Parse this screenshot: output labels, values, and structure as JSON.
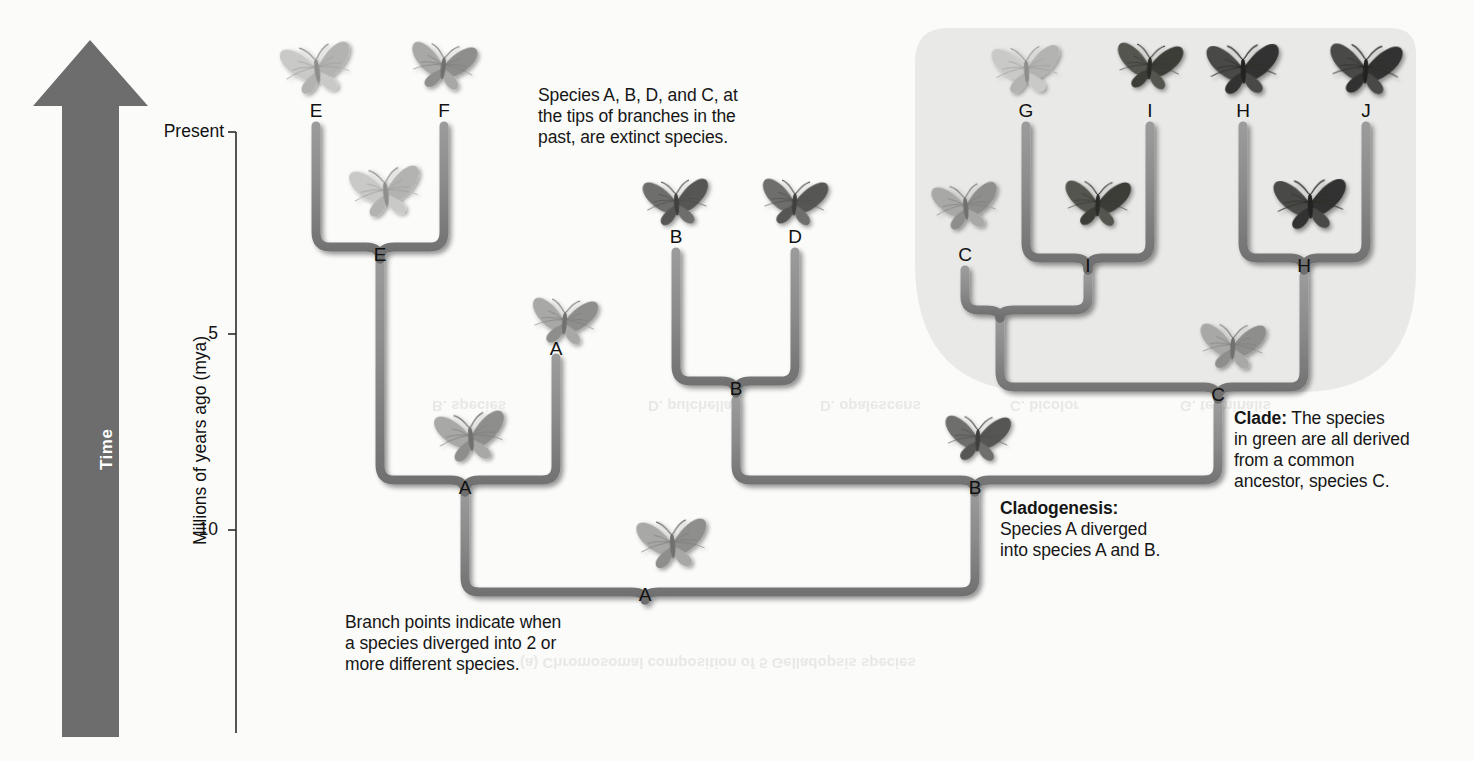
{
  "figure": {
    "type": "phylogenetic-tree"
  },
  "axis": {
    "y_title": "Millions of years ago (mya)",
    "ticks": [
      {
        "label": "Present",
        "value": 0
      },
      {
        "label": "5",
        "value": 5
      },
      {
        "label": "10",
        "value": 10
      }
    ]
  },
  "time_arrow": {
    "label": "Time",
    "direction": "up"
  },
  "annotations": [
    {
      "id": "extinct-note",
      "lead": "",
      "text": "Species A, B, D, and C, at\nthe  tips of branches in the\npast, are extinct species."
    },
    {
      "id": "clade-note",
      "lead": "Clade:",
      "text": " The species\nin green are all derived\nfrom a common\nancestor, species C."
    },
    {
      "id": "cladogenesis-note",
      "lead": "Cladogenesis:",
      "text": "\nSpecies A diverged\ninto species A and B."
    },
    {
      "id": "branch-point-note",
      "lead": "",
      "text": "Branch points indicate when\na species diverged into 2 or\nmore different species."
    }
  ],
  "tips": [
    {
      "id": "tip-E",
      "label": "E",
      "x": 316,
      "y": 113
    },
    {
      "id": "tip-F",
      "label": "F",
      "x": 444,
      "y": 113
    },
    {
      "id": "tip-B",
      "label": "B",
      "x": 676,
      "y": 239
    },
    {
      "id": "tip-D",
      "label": "D",
      "x": 795,
      "y": 239
    },
    {
      "id": "tip-A",
      "label": "A",
      "x": 556,
      "y": 351
    },
    {
      "id": "tip-G",
      "label": "G",
      "x": 1026,
      "y": 113
    },
    {
      "id": "tip-I",
      "label": "I",
      "x": 1150,
      "y": 113
    },
    {
      "id": "tip-H",
      "label": "H",
      "x": 1243,
      "y": 113
    },
    {
      "id": "tip-J",
      "label": "J",
      "x": 1366,
      "y": 113
    },
    {
      "id": "tip-C",
      "label": "C",
      "x": 965,
      "y": 257
    }
  ],
  "nodes": [
    {
      "id": "node-E",
      "label": "E",
      "x": 380,
      "y": 257
    },
    {
      "id": "node-B-mid",
      "label": "B",
      "x": 736,
      "y": 391
    },
    {
      "id": "node-A-left",
      "label": "A",
      "x": 465,
      "y": 490
    },
    {
      "id": "node-B-right",
      "label": "B",
      "x": 975,
      "y": 490
    },
    {
      "id": "node-I",
      "label": "I",
      "x": 1088,
      "y": 268
    },
    {
      "id": "node-H",
      "label": "H",
      "x": 1304,
      "y": 268
    },
    {
      "id": "node-C",
      "label": "C",
      "x": 1218,
      "y": 397
    },
    {
      "id": "node-A-root",
      "label": "A",
      "x": 645,
      "y": 597
    }
  ],
  "clade": {
    "label": "green-clade-highlight",
    "fill": "#e9e9e7",
    "members": [
      "C",
      "G",
      "I",
      "H",
      "J"
    ]
  },
  "colors": {
    "branch": "#8d8d8d",
    "branch_edge": "#6f6f6f",
    "arrow": "#6d6d6d",
    "axis": "#2b2b2b",
    "background": "#fbfbfa",
    "clade_fill": "#e9e9e7"
  },
  "butterflies": [
    {
      "id": "butterfly-E-tip",
      "x": 316,
      "y": 62,
      "w": 62,
      "shade": "light",
      "rot": -8
    },
    {
      "id": "butterfly-F-tip",
      "x": 444,
      "y": 60,
      "w": 58,
      "shade": "mid",
      "rot": 6
    },
    {
      "id": "butterfly-E-node",
      "x": 385,
      "y": 185,
      "w": 62,
      "shade": "light",
      "rot": -6
    },
    {
      "id": "butterfly-A-tip",
      "x": 565,
      "y": 315,
      "w": 58,
      "shade": "mid",
      "rot": 4
    },
    {
      "id": "butterfly-A-node",
      "x": 470,
      "y": 430,
      "w": 62,
      "shade": "mid",
      "rot": -6
    },
    {
      "id": "butterfly-B-tip",
      "x": 676,
      "y": 196,
      "w": 58,
      "shade": "dark",
      "rot": -4
    },
    {
      "id": "butterfly-D-tip",
      "x": 795,
      "y": 196,
      "w": 58,
      "shade": "dark",
      "rot": 4
    },
    {
      "id": "butterfly-B-node",
      "x": 978,
      "y": 432,
      "w": 58,
      "shade": "dark",
      "rot": 2
    },
    {
      "id": "butterfly-A-root",
      "x": 672,
      "y": 537,
      "w": 62,
      "shade": "mid",
      "rot": -4
    },
    {
      "id": "butterfly-C-tip",
      "x": 965,
      "y": 200,
      "w": 58,
      "shade": "mid",
      "rot": -6
    },
    {
      "id": "butterfly-G-tip",
      "x": 1026,
      "y": 63,
      "w": 60,
      "shade": "light",
      "rot": -4
    },
    {
      "id": "butterfly-I-tip",
      "x": 1150,
      "y": 60,
      "w": 58,
      "shade": "darker",
      "rot": 4
    },
    {
      "id": "butterfly-I-node",
      "x": 1098,
      "y": 197,
      "w": 58,
      "shade": "darker",
      "rot": 2
    },
    {
      "id": "butterfly-H-tip",
      "x": 1243,
      "y": 62,
      "w": 64,
      "shade": "darkest",
      "rot": -2
    },
    {
      "id": "butterfly-J-tip",
      "x": 1366,
      "y": 62,
      "w": 64,
      "shade": "darkest",
      "rot": 3
    },
    {
      "id": "butterfly-H-node",
      "x": 1310,
      "y": 197,
      "w": 64,
      "shade": "darkest",
      "rot": -2
    },
    {
      "id": "butterfly-C-node",
      "x": 1233,
      "y": 340,
      "w": 58,
      "shade": "mid",
      "rot": 2
    }
  ],
  "background_ghost_text": [
    {
      "id": "ghost-1",
      "text": "B. species",
      "x": 432,
      "y": 398
    },
    {
      "id": "ghost-2",
      "text": "D. pulchella",
      "x": 648,
      "y": 398
    },
    {
      "id": "ghost-3",
      "text": "D. opalescens",
      "x": 820,
      "y": 398
    },
    {
      "id": "ghost-4",
      "text": "C. bicolor",
      "x": 1010,
      "y": 398
    },
    {
      "id": "ghost-5",
      "text": "G. terminalis",
      "x": 1180,
      "y": 398
    },
    {
      "id": "ghost-6",
      "text": "(a) Chromosomal composition of 5 Gelladopsis species",
      "x": 520,
      "y": 655
    }
  ]
}
